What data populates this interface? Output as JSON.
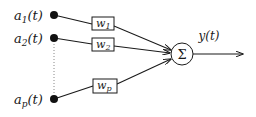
{
  "diagram": {
    "type": "neuron-weighted-sum",
    "inputs": [
      {
        "symbol": "a",
        "subscript": "1",
        "suffix": "(t)",
        "weight_symbol": "w",
        "weight_subscript": "1"
      },
      {
        "symbol": "a",
        "subscript": "2",
        "suffix": "(t)",
        "weight_symbol": "w",
        "weight_subscript": "2"
      },
      {
        "symbol": "a",
        "subscript": "p",
        "suffix": "(t)",
        "weight_symbol": "w",
        "weight_subscript": "p"
      }
    ],
    "summation": {
      "symbol": "Σ"
    },
    "output": {
      "label": "y(t)"
    },
    "ellipsis_style": "dotted vertical line between a2 and ap",
    "colors": {
      "line": "#1a1a1a",
      "node": "#111111",
      "background": "#ffffff",
      "dotted": "#888888"
    }
  }
}
